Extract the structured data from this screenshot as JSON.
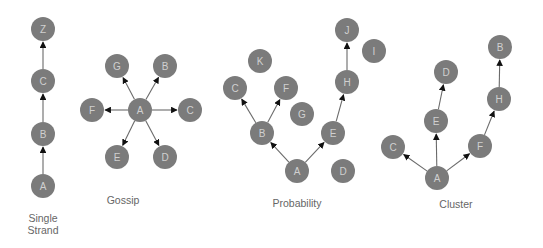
{
  "style": {
    "node_fill": "#7b7b7b",
    "node_text": "#d0d0d0",
    "edge_color": "#6a6a6a",
    "caption_color": "#666666",
    "node_radius": 12
  },
  "panels": [
    {
      "id": "single-strand",
      "caption_lines": [
        "Single",
        "Strand"
      ],
      "caption_pos": [
        43,
        222
      ],
      "nodes": [
        {
          "id": "Z",
          "x": 43,
          "y": 29
        },
        {
          "id": "C",
          "x": 43,
          "y": 81
        },
        {
          "id": "B",
          "x": 43,
          "y": 134
        },
        {
          "id": "A",
          "x": 43,
          "y": 186
        }
      ],
      "edges": [
        [
          "A",
          "B"
        ],
        [
          "B",
          "C"
        ],
        [
          "C",
          "Z"
        ]
      ]
    },
    {
      "id": "gossip",
      "caption_lines": [
        "Gossip"
      ],
      "caption_pos": [
        123,
        204
      ],
      "nodes": [
        {
          "id": "G",
          "x": 117,
          "y": 66
        },
        {
          "id": "B",
          "x": 165,
          "y": 66
        },
        {
          "id": "F",
          "x": 92,
          "y": 110
        },
        {
          "id": "A",
          "x": 140,
          "y": 110
        },
        {
          "id": "C",
          "x": 190,
          "y": 110
        },
        {
          "id": "E",
          "x": 117,
          "y": 157
        },
        {
          "id": "D",
          "x": 165,
          "y": 157
        }
      ],
      "edges": [
        [
          "A",
          "G"
        ],
        [
          "A",
          "B"
        ],
        [
          "A",
          "F"
        ],
        [
          "A",
          "C"
        ],
        [
          "A",
          "E"
        ],
        [
          "A",
          "D"
        ]
      ]
    },
    {
      "id": "probability",
      "caption_lines": [
        "Probability"
      ],
      "caption_pos": [
        297,
        207
      ],
      "nodes": [
        {
          "id": "J",
          "x": 347,
          "y": 30
        },
        {
          "id": "I",
          "x": 374,
          "y": 51
        },
        {
          "id": "K",
          "x": 260,
          "y": 61
        },
        {
          "id": "H",
          "x": 347,
          "y": 82
        },
        {
          "id": "C",
          "x": 235,
          "y": 88
        },
        {
          "id": "F",
          "x": 286,
          "y": 88
        },
        {
          "id": "G",
          "x": 302,
          "y": 114
        },
        {
          "id": "B",
          "x": 262,
          "y": 133
        },
        {
          "id": "E",
          "x": 333,
          "y": 133
        },
        {
          "id": "A",
          "x": 297,
          "y": 171
        },
        {
          "id": "D",
          "x": 343,
          "y": 171
        }
      ],
      "edges": [
        [
          "A",
          "B"
        ],
        [
          "A",
          "E"
        ],
        [
          "B",
          "C"
        ],
        [
          "B",
          "F"
        ],
        [
          "E",
          "H"
        ],
        [
          "H",
          "J"
        ]
      ]
    },
    {
      "id": "cluster",
      "caption_lines": [
        "Cluster"
      ],
      "caption_pos": [
        456,
        208
      ],
      "nodes": [
        {
          "id": "B",
          "x": 500,
          "y": 47
        },
        {
          "id": "D",
          "x": 446,
          "y": 72
        },
        {
          "id": "H",
          "x": 499,
          "y": 99
        },
        {
          "id": "E",
          "x": 436,
          "y": 121
        },
        {
          "id": "C",
          "x": 393,
          "y": 147
        },
        {
          "id": "F",
          "x": 480,
          "y": 146
        },
        {
          "id": "A",
          "x": 437,
          "y": 178
        }
      ],
      "edges": [
        [
          "A",
          "C"
        ],
        [
          "A",
          "E"
        ],
        [
          "A",
          "F"
        ],
        [
          "E",
          "D"
        ],
        [
          "F",
          "H"
        ],
        [
          "H",
          "B"
        ]
      ]
    }
  ]
}
